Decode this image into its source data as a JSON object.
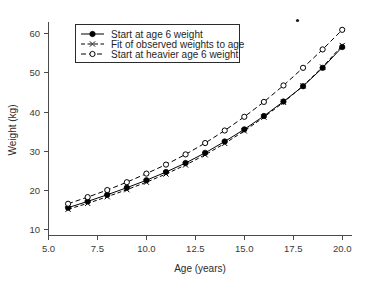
{
  "chart_data": {
    "type": "line",
    "title": "",
    "xlabel": "Age (years)",
    "ylabel": "Weight (kg)",
    "xlim": [
      5.0,
      20.5
    ],
    "ylim": [
      8.5,
      63.0
    ],
    "xticks": [
      "5.0",
      "7.5",
      "10.0",
      "12.5",
      "15.0",
      "17.5",
      "20.0"
    ],
    "xtick_values": [
      5.0,
      7.5,
      10.0,
      12.5,
      15.0,
      17.5,
      20.0
    ],
    "yticks": [
      "10",
      "20",
      "30",
      "40",
      "50",
      "60"
    ],
    "ytick_values": [
      10,
      20,
      30,
      40,
      50,
      60
    ],
    "grid": false,
    "legend_position": "upper-left",
    "x": [
      6,
      7,
      8,
      9,
      10,
      11,
      12,
      13,
      14,
      15,
      16,
      17,
      18,
      19,
      20
    ],
    "series": [
      {
        "name": "Start at age 6 weight",
        "line_style": "solid",
        "marker": "filled-circle",
        "values": [
          15.6,
          17.2,
          18.9,
          20.7,
          22.6,
          24.7,
          27.0,
          29.6,
          32.5,
          35.6,
          39.0,
          42.7,
          46.6,
          51.3,
          56.6
        ]
      },
      {
        "name": "Fit of observed weights to age",
        "line_style": "dash-dot",
        "marker": "x",
        "values": [
          15.2,
          16.7,
          18.4,
          20.2,
          22.1,
          24.2,
          26.5,
          29.1,
          32.0,
          35.2,
          38.7,
          42.5,
          46.7,
          51.5,
          57.0
        ]
      },
      {
        "name": "Start at heavier age 6 weight",
        "line_style": "dashed",
        "marker": "open-circle",
        "values": [
          16.6,
          18.3,
          20.1,
          22.1,
          24.3,
          26.6,
          29.2,
          32.1,
          35.3,
          38.8,
          42.6,
          46.8,
          51.3,
          56.0,
          61.0
        ]
      }
    ]
  },
  "legend": {
    "entries": [
      {
        "label": "Start at age 6 weight"
      },
      {
        "label": "Fit of observed weights to age"
      },
      {
        "label": "Start at heavier age 6 weight"
      }
    ]
  },
  "axes": {
    "x_title": "Age (years)",
    "y_title": "Weight (kg)"
  }
}
